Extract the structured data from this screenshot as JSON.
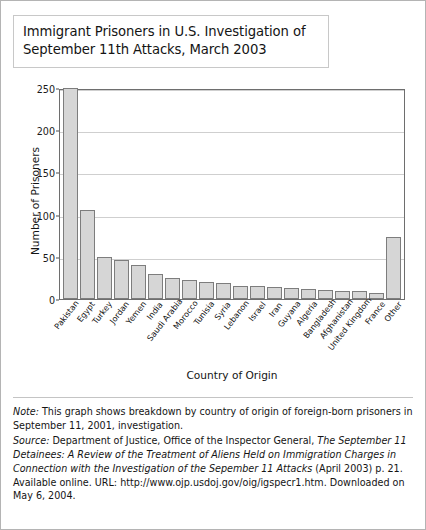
{
  "title": "Immigrant Prisoners in U.S. Investigation of September 11th Attacks, March 2003",
  "chart_data": {
    "type": "bar",
    "title": "Immigrant Prisoners in U.S. Investigation of September 11th Attacks, March 2003",
    "xlabel": "Country of Origin",
    "ylabel": "Number of  Prisoners",
    "ylim": [
      0,
      250
    ],
    "yticks": [
      0,
      50,
      100,
      150,
      200,
      250
    ],
    "grid": true,
    "legend": "none",
    "categories": [
      "Pakistan",
      "Egypt",
      "Turkey",
      "Jordan",
      "Yemen",
      "India",
      "Saudi Arabia",
      "Morocco",
      "Tunisia",
      "Syria",
      "Lebanon",
      "Israel",
      "Iran",
      "Guyana",
      "Algeria",
      "Bangladesh",
      "Afghanistan",
      "United Kingdom",
      "France",
      "Other"
    ],
    "values": [
      250,
      105,
      50,
      46,
      40,
      30,
      25,
      22,
      20,
      19,
      16,
      16,
      14,
      13,
      12,
      11,
      10,
      9,
      7,
      73
    ]
  },
  "footnote": {
    "note_label": "Note:",
    "note_text": " This graph shows breakdown by country of origin of foreign-born prisoners in September 11, 2001, investigation.",
    "source_label": "Source:",
    "source_text_1": " Department of Justice, Office of the Inspector General, ",
    "source_title": "The September 11 Detainees: A Review of the Treatment of Aliens Held on Immigration Charges in Connection with the Investigation of the Sepember 11 Attacks",
    "source_text_2": " (April 2003) p. 21. Available online. URL: http://www.ojp.usdoj.gov/oig/igspecr1.htm. Downloaded on May 6, 2004."
  }
}
